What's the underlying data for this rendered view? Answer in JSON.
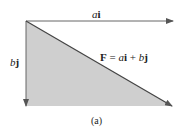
{
  "diagram": {
    "labels": {
      "horizontal_vector_coef": "a",
      "horizontal_vector_unit": "i",
      "vertical_vector_coef": "b",
      "vertical_vector_unit": "j",
      "resultant_symbol": "F",
      "resultant_eq": " = ",
      "resultant_a": "a",
      "resultant_i": "i",
      "resultant_plus": " + ",
      "resultant_b": "b",
      "resultant_j": "j",
      "caption": "(a)"
    },
    "colors": {
      "fill": "#cfcfcf",
      "arrow": "#555555",
      "text": "#222222"
    }
  }
}
